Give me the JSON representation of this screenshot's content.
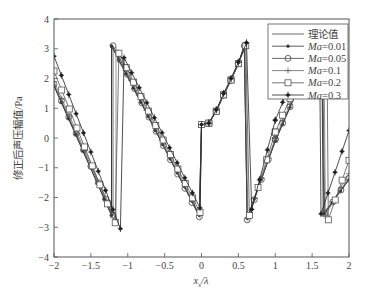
{
  "chart_data": {
    "type": "line",
    "title": "",
    "xlabel": "x_s/λ",
    "xlabel_main": "x",
    "xlabel_sub": "s",
    "xlabel_rest": "/λ",
    "ylabel": "修正后声压幅值/Pa",
    "xlim": [
      -2,
      2
    ],
    "ylim": [
      -4,
      4
    ],
    "xticks": [
      -2,
      -1.5,
      -1,
      -0.5,
      0,
      0.5,
      1,
      1.5,
      2
    ],
    "xtick_labels": [
      "−2",
      "−1.5",
      "−1",
      "−0.5",
      "0",
      "0.5",
      "1",
      "1.5",
      "2"
    ],
    "yticks": [
      -4,
      -3,
      -2,
      -1,
      0,
      1,
      2,
      3,
      4
    ],
    "ytick_labels": [
      "−4",
      "−3",
      "−2",
      "−1",
      "0",
      "1",
      "2",
      "3",
      "4"
    ],
    "grid": false,
    "legend_position": "upper right",
    "legend": [
      "理论值",
      "Ma=0.01",
      "Ma=0.05",
      "Ma=0.1",
      "Ma=0.2",
      "Ma=0.3"
    ],
    "series": [
      {
        "name": "理论值",
        "label_prefix": "理论值",
        "label_suffix": "",
        "marker": "none",
        "points": [
          [
            -2,
            1.75
          ],
          [
            -1.22,
            -2.6
          ],
          [
            -1.22,
            3.1
          ],
          [
            -0.03,
            -2.6
          ],
          [
            0,
            0.45
          ],
          [
            0.1,
            0.5
          ],
          [
            0.2,
            0.9
          ],
          [
            0.3,
            1.45
          ],
          [
            0.4,
            1.95
          ],
          [
            0.5,
            2.5
          ],
          [
            0.58,
            3.1
          ],
          [
            0.62,
            -2.7
          ],
          [
            1.0,
            -0.1
          ],
          [
            1.3,
            1.6
          ],
          [
            1.63,
            3.3
          ],
          [
            1.65,
            -2.55
          ],
          [
            2,
            -1.4
          ]
        ]
      },
      {
        "name": "Ma=0.01",
        "label_prefix": "Ma",
        "label_suffix": "=0.01",
        "marker": "dot",
        "points": [
          [
            -2,
            1.75
          ],
          [
            -1.22,
            -2.6
          ],
          [
            -1.22,
            3.1
          ],
          [
            -0.03,
            -2.6
          ],
          [
            0,
            0.45
          ],
          [
            0.1,
            0.5
          ],
          [
            0.2,
            0.9
          ],
          [
            0.3,
            1.45
          ],
          [
            0.4,
            1.95
          ],
          [
            0.5,
            2.5
          ],
          [
            0.58,
            3.1
          ],
          [
            0.62,
            -2.7
          ],
          [
            1.0,
            -0.1
          ],
          [
            1.3,
            1.6
          ],
          [
            1.63,
            3.3
          ],
          [
            1.66,
            -2.55
          ],
          [
            2,
            -1.4
          ]
        ]
      },
      {
        "name": "Ma=0.05",
        "label_prefix": "Ma",
        "label_suffix": "=0.05",
        "marker": "circle",
        "points": [
          [
            -2,
            1.8
          ],
          [
            -1.2,
            -2.6
          ],
          [
            -1.2,
            3.1
          ],
          [
            -0.03,
            -2.65
          ],
          [
            0,
            0.45
          ],
          [
            0.1,
            0.5
          ],
          [
            0.2,
            0.9
          ],
          [
            0.3,
            1.45
          ],
          [
            0.4,
            1.95
          ],
          [
            0.5,
            2.5
          ],
          [
            0.58,
            3.1
          ],
          [
            0.62,
            -2.75
          ],
          [
            1.0,
            -0.05
          ],
          [
            1.3,
            1.6
          ],
          [
            1.64,
            3.3
          ],
          [
            1.67,
            -2.55
          ],
          [
            2,
            -1.35
          ]
        ]
      },
      {
        "name": "Ma=0.1",
        "label_prefix": "Ma",
        "label_suffix": "=0.1",
        "marker": "plus",
        "points": [
          [
            -2,
            1.9
          ],
          [
            -1.16,
            -2.75
          ],
          [
            -1.16,
            2.95
          ],
          [
            -0.02,
            -2.6
          ],
          [
            0,
            0.45
          ],
          [
            0.1,
            0.5
          ],
          [
            0.2,
            0.9
          ],
          [
            0.3,
            1.45
          ],
          [
            0.4,
            1.95
          ],
          [
            0.5,
            2.5
          ],
          [
            0.59,
            3.1
          ],
          [
            0.63,
            -2.7
          ],
          [
            1.0,
            0.0
          ],
          [
            1.3,
            1.7
          ],
          [
            1.66,
            3.3
          ],
          [
            1.68,
            -2.6
          ],
          [
            2,
            -1.2
          ]
        ]
      },
      {
        "name": "Ma=0.2",
        "label_prefix": "Ma",
        "label_suffix": "=0.2",
        "marker": "square",
        "points": [
          [
            -2,
            2.25
          ],
          [
            -1.17,
            -2.85
          ],
          [
            -1.12,
            2.85
          ],
          [
            -0.02,
            -2.5
          ],
          [
            0,
            0.45
          ],
          [
            0.1,
            0.5
          ],
          [
            0.2,
            0.9
          ],
          [
            0.3,
            1.45
          ],
          [
            0.4,
            1.95
          ],
          [
            0.5,
            2.5
          ],
          [
            0.6,
            3.1
          ],
          [
            0.65,
            -2.6
          ],
          [
            1.0,
            0.2
          ],
          [
            1.3,
            1.9
          ],
          [
            1.7,
            3.3
          ],
          [
            1.72,
            -2.75
          ],
          [
            2,
            -0.75
          ]
        ]
      },
      {
        "name": "Ma=0.3",
        "label_prefix": "Ma",
        "label_suffix": "=0.3",
        "marker": "star",
        "points": [
          [
            -2,
            2.75
          ],
          [
            -1.1,
            -3.05
          ],
          [
            -1.05,
            2.7
          ],
          [
            -0.02,
            -2.35
          ],
          [
            0,
            0.45
          ],
          [
            0.1,
            0.5
          ],
          [
            0.2,
            0.95
          ],
          [
            0.3,
            1.5
          ],
          [
            0.4,
            2.0
          ],
          [
            0.5,
            2.55
          ],
          [
            0.61,
            3.2
          ],
          [
            0.68,
            -2.4
          ],
          [
            1.0,
            0.6
          ],
          [
            1.3,
            2.4
          ],
          [
            1.6,
            3.3
          ],
          [
            1.62,
            -2.55
          ],
          [
            2,
            0.25
          ]
        ]
      }
    ]
  }
}
